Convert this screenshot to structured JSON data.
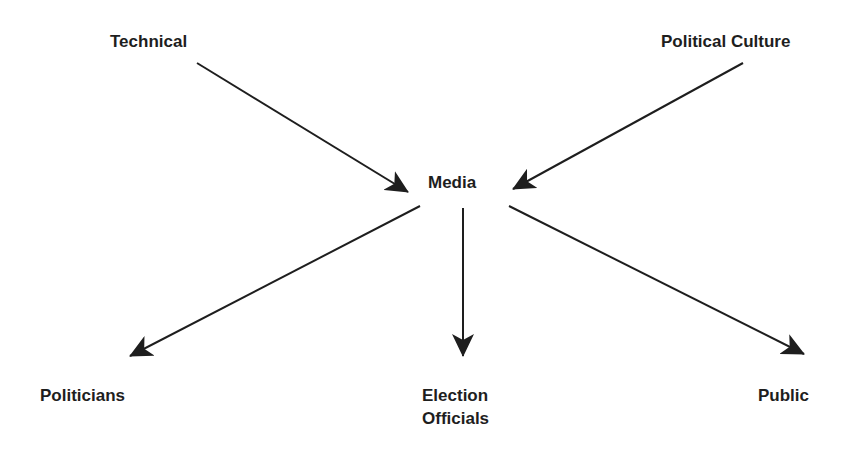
{
  "diagram": {
    "type": "flow",
    "nodes": [
      {
        "id": "technical",
        "label": "Technical"
      },
      {
        "id": "political_culture",
        "label": "Political Culture"
      },
      {
        "id": "media",
        "label": "Media"
      },
      {
        "id": "politicians",
        "label": "Politicians"
      },
      {
        "id": "election_officials",
        "label_line1": "Election",
        "label_line2": "Officials"
      },
      {
        "id": "public",
        "label": "Public"
      }
    ],
    "edges": [
      {
        "from": "technical",
        "to": "media"
      },
      {
        "from": "political_culture",
        "to": "media"
      },
      {
        "from": "media",
        "to": "politicians"
      },
      {
        "from": "media",
        "to": "election_officials"
      },
      {
        "from": "media",
        "to": "public"
      }
    ],
    "colors": {
      "line": "#1e1e1e",
      "background": "#ffffff"
    }
  }
}
